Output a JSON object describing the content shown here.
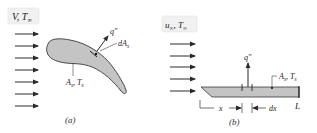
{
  "panel_a": {
    "flow_label": "V, T∞",
    "flow_label_main": "V, T",
    "flow_label_sub": "∞",
    "heat_flux_label": "q\"",
    "element_label": "dA",
    "element_label_sub": "s",
    "surface_label": "A",
    "surface_label_sub": "s",
    "surface_temp_label": "T",
    "surface_temp_sub": "s",
    "caption": "(a)",
    "arrow_count": 7
  },
  "panel_b": {
    "flow_label_main": "u",
    "flow_label_sub": "∞",
    "flow_label_T": "T",
    "flow_label_T_sub": "∞",
    "heat_flux_label": "q\"",
    "surface_label": "A",
    "surface_label_sub": "s",
    "surface_temp_label": "T",
    "surface_temp_sub": "s",
    "length_label": "L",
    "x_label": "x",
    "dx_label": "dx",
    "caption": "(b)",
    "arrow_count": 5
  },
  "colors": {
    "body_fill": "#c4c4c4",
    "outline": "#3a3a3a",
    "arrow": "#2a2a2a",
    "label_bg": "#f1f1f1"
  }
}
